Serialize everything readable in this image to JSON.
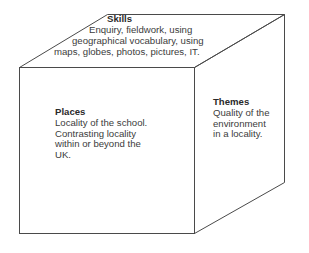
{
  "diagram": {
    "type": "cube",
    "stroke_color": "#4a4a4a",
    "background": "#ffffff",
    "faces": {
      "top": {
        "title": "Skills",
        "lines": [
          "Enquiry, fieldwork, using",
          "geographical vocabulary, using",
          "maps, globes, photos, pictures, IT."
        ]
      },
      "front": {
        "title": "Places",
        "lines": [
          "Locality of the school.",
          "Contrasting locality",
          "within or beyond the",
          "UK."
        ]
      },
      "side": {
        "title": "Themes",
        "lines": [
          "Quality of the",
          "environment",
          "in a locality."
        ]
      }
    }
  }
}
